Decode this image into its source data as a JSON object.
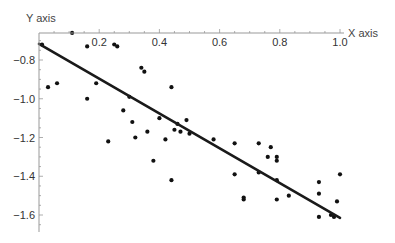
{
  "chart_data": {
    "type": "scatter",
    "title": "",
    "xlabel": "X axis",
    "ylabel": "Y axis",
    "xlim": [
      0,
      1.0
    ],
    "ylim": [
      -1.66,
      -0.66
    ],
    "x_ticks": [
      0.2,
      0.4,
      0.6,
      0.8,
      1.0
    ],
    "x_tick_labels": [
      "0.2",
      "0.4",
      "0.6",
      "0.8",
      "1.0"
    ],
    "y_ticks": [
      -0.8,
      -1.0,
      -1.2,
      -1.4,
      -1.6
    ],
    "y_tick_labels": [
      "-0.8",
      "-1.0",
      "-1.2",
      "-1.4",
      "-1.6"
    ],
    "grid": false,
    "legend": null,
    "series": [
      {
        "name": "data points",
        "type": "scatter",
        "points": [
          [
            0.01,
            -0.72
          ],
          [
            0.03,
            -0.94
          ],
          [
            0.06,
            -0.92
          ],
          [
            0.11,
            -0.66
          ],
          [
            0.16,
            -0.73
          ],
          [
            0.16,
            -1.0
          ],
          [
            0.19,
            -0.92
          ],
          [
            0.25,
            -0.72
          ],
          [
            0.26,
            -0.73
          ],
          [
            0.23,
            -1.22
          ],
          [
            0.28,
            -1.06
          ],
          [
            0.3,
            -0.99
          ],
          [
            0.31,
            -1.12
          ],
          [
            0.32,
            -1.2
          ],
          [
            0.34,
            -0.84
          ],
          [
            0.35,
            -0.86
          ],
          [
            0.36,
            -1.17
          ],
          [
            0.38,
            -1.32
          ],
          [
            0.4,
            -1.1
          ],
          [
            0.42,
            -1.21
          ],
          [
            0.44,
            -0.94
          ],
          [
            0.44,
            -1.42
          ],
          [
            0.45,
            -1.16
          ],
          [
            0.46,
            -1.13
          ],
          [
            0.47,
            -1.17
          ],
          [
            0.49,
            -1.11
          ],
          [
            0.5,
            -1.18
          ],
          [
            0.58,
            -1.21
          ],
          [
            0.65,
            -1.39
          ],
          [
            0.65,
            -1.23
          ],
          [
            0.68,
            -1.51
          ],
          [
            0.73,
            -1.23
          ],
          [
            0.68,
            -1.52
          ],
          [
            0.76,
            -1.3
          ],
          [
            0.79,
            -1.3
          ],
          [
            0.77,
            -1.25
          ],
          [
            0.79,
            -1.32
          ],
          [
            0.73,
            -1.38
          ],
          [
            0.79,
            -1.42
          ],
          [
            0.79,
            -1.52
          ],
          [
            0.83,
            -1.5
          ],
          [
            0.93,
            -1.43
          ],
          [
            0.93,
            -1.49
          ],
          [
            0.97,
            -1.6
          ],
          [
            0.98,
            -1.61
          ],
          [
            0.99,
            -1.53
          ],
          [
            1.0,
            -1.39
          ],
          [
            0.93,
            -1.61
          ]
        ]
      },
      {
        "name": "fit line",
        "type": "line",
        "points": [
          [
            0.0,
            -0.717
          ],
          [
            1.0,
            -1.615
          ]
        ]
      }
    ]
  }
}
